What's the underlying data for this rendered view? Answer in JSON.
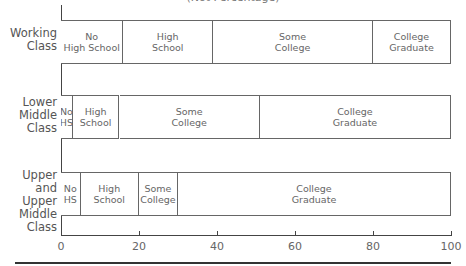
{
  "chart_data": {
    "type": "bar",
    "orientation": "horizontal",
    "stacked": true,
    "title": "(Not Percentage)",
    "xlabel": "",
    "ylabel": "",
    "xlim": [
      0,
      100
    ],
    "xticks": [
      0,
      20,
      40,
      60,
      80,
      100
    ],
    "grid": false,
    "categories": [
      "Working Class",
      "Lower Middle Class",
      "Upper and Upper Middle Class"
    ],
    "category_labels": [
      [
        "Working",
        "Class"
      ],
      [
        "Lower",
        "Middle",
        "Class"
      ],
      [
        "Upper",
        "and Upper",
        "Middle",
        "Class"
      ]
    ],
    "series": [
      {
        "name": "No High School",
        "values": [
          16,
          3,
          5
        ],
        "labels": [
          [
            "No",
            "High School"
          ],
          [
            "No",
            "HS"
          ],
          [
            "No",
            "HS"
          ]
        ]
      },
      {
        "name": "High School",
        "values": [
          23,
          12,
          15
        ],
        "labels": [
          [
            "High",
            "School"
          ],
          [
            "High",
            "School"
          ],
          [
            "High",
            "School"
          ]
        ]
      },
      {
        "name": "Some College",
        "values": [
          41,
          36,
          10
        ],
        "labels": [
          [
            "Some",
            "College"
          ],
          [
            "Some",
            "College"
          ],
          [
            "Some",
            "College"
          ]
        ]
      },
      {
        "name": "College Graduate",
        "values": [
          20,
          49,
          70
        ],
        "labels": [
          [
            "College",
            "Graduate"
          ],
          [
            "College",
            "Graduate"
          ],
          [
            "College",
            "Graduate"
          ]
        ]
      }
    ]
  },
  "layout": {
    "bar_tops": [
      20,
      95,
      172
    ],
    "label_tops": [
      27,
      96,
      169
    ]
  }
}
